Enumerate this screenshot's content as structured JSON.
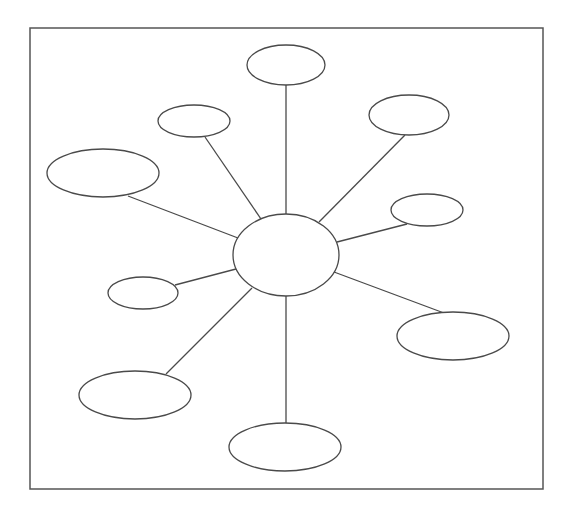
{
  "diagram": {
    "type": "spider-map",
    "frame": {
      "x": 30,
      "y": 28,
      "width": 513,
      "height": 461
    },
    "colors": {
      "stroke": "#4a4a4a",
      "frame": "#555555",
      "fill": "#ffffff"
    },
    "center": {
      "id": "center",
      "cx": 286,
      "cy": 255,
      "rx": 53,
      "ry": 41,
      "label": ""
    },
    "nodes": [
      {
        "id": "top",
        "cx": 286,
        "cy": 65,
        "rx": 39,
        "ry": 20,
        "label": "",
        "edge_from": [
          286,
          214
        ],
        "edge_to": [
          286,
          85
        ]
      },
      {
        "id": "upper-left",
        "cx": 194,
        "cy": 121,
        "rx": 36,
        "ry": 16,
        "label": "",
        "edge_from": [
          261,
          219
        ],
        "edge_to": [
          205,
          137
        ]
      },
      {
        "id": "left",
        "cx": 103,
        "cy": 173,
        "rx": 56,
        "ry": 24,
        "label": "",
        "edge_from": [
          238,
          238
        ],
        "edge_to": [
          128,
          196
        ]
      },
      {
        "id": "upper-right",
        "cx": 409,
        "cy": 115,
        "rx": 40,
        "ry": 20,
        "label": "",
        "edge_from": [
          319,
          222
        ],
        "edge_to": [
          405,
          135
        ]
      },
      {
        "id": "right",
        "cx": 427,
        "cy": 210,
        "rx": 36,
        "ry": 16,
        "label": "",
        "edge_from": [
          337,
          242
        ],
        "edge_to": [
          407,
          224
        ]
      },
      {
        "id": "left-small",
        "cx": 143,
        "cy": 293,
        "rx": 35,
        "ry": 16,
        "label": "",
        "edge_from": [
          236,
          269
        ],
        "edge_to": [
          175,
          285
        ]
      },
      {
        "id": "lower-left",
        "cx": 135,
        "cy": 395,
        "rx": 56,
        "ry": 24,
        "label": "",
        "edge_from": [
          252,
          288
        ],
        "edge_to": [
          166,
          374
        ]
      },
      {
        "id": "bottom",
        "cx": 285,
        "cy": 447,
        "rx": 56,
        "ry": 24,
        "label": "",
        "edge_from": [
          286,
          296
        ],
        "edge_to": [
          286,
          423
        ]
      },
      {
        "id": "lower-right",
        "cx": 453,
        "cy": 336,
        "rx": 56,
        "ry": 24,
        "label": "",
        "edge_from": [
          334,
          272
        ],
        "edge_to": [
          444,
          313
        ]
      }
    ]
  }
}
